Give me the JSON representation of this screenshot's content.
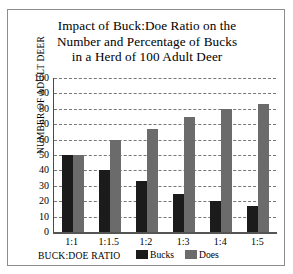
{
  "chart_data": {
    "type": "bar",
    "title": "Impact of Buck:Doe Ratio on the Number and Percentage of Bucks in a Herd of 100 Adult Deer",
    "title_lines": [
      "Impact of Buck:Doe Ratio on the",
      "Number and Percentage of Bucks",
      "in a Herd of 100 Adult Deer"
    ],
    "xlabel": "BUCK:DOE RATIO",
    "ylabel": "NUMBER OF ADULT DEER",
    "categories": [
      "1:1",
      "1:1.5",
      "1:2",
      "1:3",
      "1:4",
      "1:5"
    ],
    "series": [
      {
        "name": "Bucks",
        "color": "#1b1b1b",
        "values": [
          50,
          40,
          33,
          25,
          20,
          17
        ]
      },
      {
        "name": "Does",
        "color": "#6b6b6b",
        "values": [
          50,
          60,
          67,
          75,
          80,
          83
        ]
      }
    ],
    "ylim": [
      0,
      100
    ],
    "ytick_labels": [
      "100",
      "90",
      "80",
      "70",
      "60",
      "50",
      "40",
      "30",
      "20",
      "10",
      "0"
    ],
    "ytick_values": [
      100,
      90,
      80,
      70,
      60,
      50,
      40,
      30,
      20,
      10,
      0
    ],
    "grid": true,
    "grid_style": "dashed-horizontal",
    "legend_position": "bottom-center",
    "legend": [
      {
        "label": "Bucks",
        "color": "#1b1b1b"
      },
      {
        "label": "Does",
        "color": "#6b6b6b"
      }
    ]
  }
}
